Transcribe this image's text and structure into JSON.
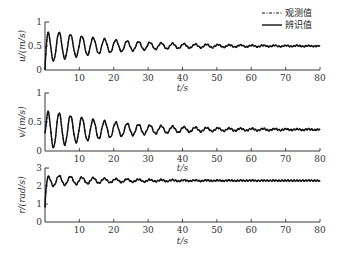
{
  "legend": {
    "items": [
      {
        "label": "观测值",
        "style": "dash-dot"
      },
      {
        "label": "辨识值",
        "style": "solid"
      }
    ]
  },
  "chart_data": [
    {
      "type": "line",
      "title": "",
      "xlabel": "t/s",
      "ylabel": "u/(m/s)",
      "xlim": [
        0,
        80
      ],
      "ylim": [
        0,
        1
      ],
      "xticks": [
        10,
        20,
        30,
        40,
        50,
        60,
        70,
        80
      ],
      "yticks": [
        0,
        0.5,
        1
      ],
      "ytick_labels": [
        "0",
        "0.5",
        "1"
      ],
      "grid": false,
      "series": [
        {
          "name": "观测值",
          "style": "dash-dot",
          "model": {
            "start": 0.0,
            "final": 0.5,
            "amp": 0.35,
            "period": 3.3,
            "decay": 0.05
          }
        },
        {
          "name": "辨识值",
          "style": "solid",
          "model": {
            "start": 0.0,
            "final": 0.5,
            "amp": 0.35,
            "period": 3.3,
            "decay": 0.05
          }
        }
      ],
      "x": [
        0,
        1,
        2.5,
        4,
        6,
        8,
        10,
        15,
        20,
        30,
        40,
        50,
        60,
        70,
        80
      ],
      "values_approx": [
        0.0,
        0.6,
        0.82,
        0.3,
        0.75,
        0.35,
        0.7,
        0.6,
        0.58,
        0.55,
        0.52,
        0.5,
        0.5,
        0.5,
        0.5
      ]
    },
    {
      "type": "line",
      "title": "",
      "xlabel": "t/s",
      "ylabel": "v/(m/s)",
      "xlim": [
        0,
        80
      ],
      "ylim": [
        0,
        1
      ],
      "xticks": [
        10,
        20,
        30,
        40,
        50,
        60,
        70,
        80
      ],
      "yticks": [
        0,
        0.5,
        1
      ],
      "ytick_labels": [
        "0",
        "0.5",
        "1"
      ],
      "grid": false,
      "series": [
        {
          "name": "观测值",
          "style": "dash-dot",
          "model": {
            "start": 0.3,
            "final": 0.37,
            "amp": 0.35,
            "period": 3.3,
            "decay": 0.05
          }
        },
        {
          "name": "辨识值",
          "style": "solid",
          "model": {
            "start": 0.3,
            "final": 0.37,
            "amp": 0.35,
            "period": 3.3,
            "decay": 0.05
          }
        }
      ],
      "x": [
        0,
        1,
        2.5,
        4,
        6,
        8,
        10,
        15,
        20,
        30,
        40,
        50,
        60,
        70,
        80
      ],
      "values_approx": [
        0.3,
        0.72,
        0.15,
        0.62,
        0.2,
        0.55,
        0.28,
        0.48,
        0.3,
        0.4,
        0.37,
        0.37,
        0.37,
        0.37,
        0.37
      ]
    },
    {
      "type": "line",
      "title": "",
      "xlabel": "t/s",
      "ylabel": "r/(rad/s)",
      "xlim": [
        0,
        80
      ],
      "ylim": [
        0,
        3
      ],
      "xticks": [
        10,
        20,
        30,
        40,
        50,
        60,
        70,
        80
      ],
      "yticks": [
        0,
        1,
        2,
        3
      ],
      "ytick_labels": [
        "0",
        "1",
        "2",
        "3"
      ],
      "grid": false,
      "series": [
        {
          "name": "观测值",
          "style": "dash-dot",
          "model": {
            "start": 0.8,
            "final": 2.3,
            "amp": 0.35,
            "period": 3.3,
            "decay": 0.06
          }
        },
        {
          "name": "辨识值",
          "style": "solid",
          "model": {
            "start": 0.8,
            "final": 2.3,
            "amp": 0.35,
            "period": 3.3,
            "decay": 0.06
          }
        }
      ],
      "x": [
        0,
        0.5,
        1,
        3,
        5,
        7,
        10,
        15,
        20,
        30,
        40,
        50,
        60,
        70,
        80
      ],
      "values_approx": [
        0.8,
        2.1,
        2.0,
        2.6,
        2.1,
        2.5,
        2.2,
        2.4,
        2.3,
        2.3,
        2.3,
        2.3,
        2.3,
        2.3,
        2.3
      ]
    }
  ]
}
